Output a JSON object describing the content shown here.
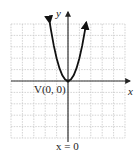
{
  "chart_data": {
    "type": "line",
    "title": "",
    "function": "y = 2x^2",
    "xlabel": "x",
    "ylabel": "y",
    "xlim": [
      -5,
      5
    ],
    "ylim": [
      -5,
      5
    ],
    "grid": true,
    "grid_spacing": 1,
    "series": [
      {
        "name": "parabola",
        "x": [
          -1.6,
          -1.5,
          -1.25,
          -1,
          -0.75,
          -0.5,
          -0.25,
          0,
          0.25,
          0.5,
          0.75,
          1,
          1.25,
          1.5,
          1.6
        ],
        "y": [
          5.12,
          4.5,
          3.125,
          2,
          1.125,
          0.5,
          0.125,
          0,
          0.125,
          0.5,
          1.125,
          2,
          3.125,
          4.5,
          5.12
        ],
        "color": "#111111",
        "arrows_at_ends": true
      }
    ],
    "annotations": [
      {
        "text": "V(0, 0)",
        "x": 0,
        "y": 0,
        "role": "vertex-label"
      },
      {
        "text": "x = 0",
        "role": "axis-of-symmetry-label"
      }
    ]
  },
  "labels": {
    "x_axis": "x",
    "y_axis": "y",
    "vertex": "V(0, 0)",
    "axis_of_symmetry": "x = 0"
  },
  "colors": {
    "axis": "#333333",
    "grid": "#c8c8c8",
    "curve": "#111111",
    "background": "#ffffff"
  }
}
